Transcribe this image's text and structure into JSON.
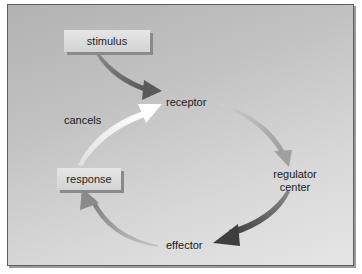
{
  "diagram": {
    "type": "feedback-loop",
    "nodes": {
      "stimulus": "stimulus",
      "receptor": "receptor",
      "regulator_line1": "regulator",
      "regulator_line2": "center",
      "effector": "effector",
      "response": "response"
    },
    "edge_labels": {
      "cancels": "cancels"
    },
    "edges": [
      {
        "from": "stimulus",
        "to": "receptor",
        "color": "#6e6e6e"
      },
      {
        "from": "receptor",
        "to": "regulator center",
        "color": "#a9a9a9"
      },
      {
        "from": "regulator center",
        "to": "effector",
        "color": "#5a5a5a"
      },
      {
        "from": "effector",
        "to": "response",
        "color": "#8c8c8c"
      },
      {
        "from": "response",
        "to": "receptor",
        "label": "cancels",
        "color": "#f2f2f2"
      }
    ]
  }
}
